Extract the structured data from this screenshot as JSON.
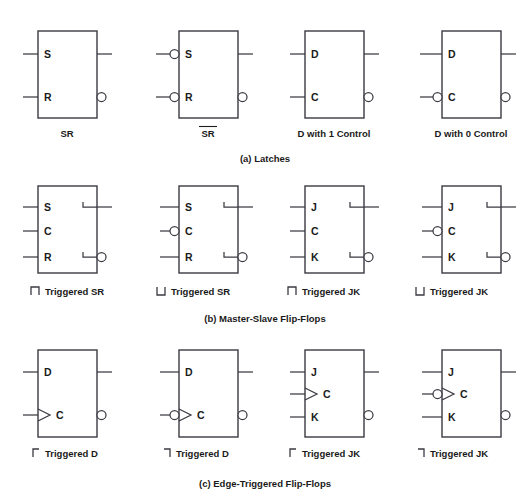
{
  "figure": {
    "background": "#ffffff",
    "line_color": "#3a3a42",
    "text_color": "#1a1a1a",
    "sections": [
      {
        "id": "a",
        "caption": "(a) Latches"
      },
      {
        "id": "b",
        "caption": "(b) Master-Slave Flip-Flops"
      },
      {
        "id": "c",
        "caption": "(c) Edge-Triggered Flip-Flops"
      }
    ]
  },
  "row_a": {
    "symbols": [
      {
        "caption": "SR",
        "caption_overline": false,
        "pins": [
          "S",
          "R"
        ],
        "inverted_inputs": [],
        "output_bubble": true,
        "postponed_output": false,
        "dynamic_input": false,
        "dynamic_input_bubble": false
      },
      {
        "caption": "SR",
        "caption_overline": true,
        "pins": [
          "S",
          "R"
        ],
        "inverted_inputs": [
          "S",
          "R"
        ],
        "output_bubble": true,
        "postponed_output": false,
        "dynamic_input": false,
        "dynamic_input_bubble": false
      },
      {
        "caption": "D with 1 Control",
        "caption_overline": false,
        "pins": [
          "D",
          "C"
        ],
        "inverted_inputs": [],
        "output_bubble": true,
        "postponed_output": false,
        "dynamic_input": false,
        "dynamic_input_bubble": false
      },
      {
        "caption": "D with 0 Control",
        "caption_overline": false,
        "pins": [
          "D",
          "C"
        ],
        "inverted_inputs": [
          "C"
        ],
        "output_bubble": true,
        "postponed_output": false,
        "dynamic_input": false,
        "dynamic_input_bubble": false
      }
    ]
  },
  "row_b": {
    "symbols": [
      {
        "caption": "Triggered SR",
        "glyph": "positive-pulse",
        "pins": [
          "S",
          "C",
          "R"
        ],
        "inverted_inputs": [],
        "output_bubble": true,
        "postponed_output": true
      },
      {
        "caption": "Triggered SR",
        "glyph": "negative-pulse",
        "pins": [
          "S",
          "C",
          "R"
        ],
        "inverted_inputs": [
          "C"
        ],
        "output_bubble": true,
        "postponed_output": true
      },
      {
        "caption": "Triggered JK",
        "glyph": "positive-pulse",
        "pins": [
          "J",
          "C",
          "K"
        ],
        "inverted_inputs": [],
        "output_bubble": true,
        "postponed_output": true
      },
      {
        "caption": "Triggered JK",
        "glyph": "negative-pulse",
        "pins": [
          "J",
          "C",
          "K"
        ],
        "inverted_inputs": [
          "C"
        ],
        "output_bubble": true,
        "postponed_output": true
      }
    ]
  },
  "row_c": {
    "symbols": [
      {
        "caption": "Triggered D",
        "glyph": "rising-edge",
        "pins": [
          "D",
          "C"
        ],
        "inverted_inputs": [],
        "output_bubble": true,
        "dynamic_input": true,
        "dynamic_input_bubble": false
      },
      {
        "caption": "Triggered D",
        "glyph": "falling-edge",
        "pins": [
          "D",
          "C"
        ],
        "inverted_inputs": [
          "C"
        ],
        "output_bubble": true,
        "dynamic_input": true,
        "dynamic_input_bubble": true
      },
      {
        "caption": "Triggered JK",
        "glyph": "rising-edge",
        "pins": [
          "J",
          "C",
          "K"
        ],
        "inverted_inputs": [],
        "output_bubble": true,
        "dynamic_input": true,
        "dynamic_input_bubble": false
      },
      {
        "caption": "Triggered JK",
        "glyph": "falling-edge",
        "pins": [
          "J",
          "C",
          "K"
        ],
        "inverted_inputs": [
          "C"
        ],
        "output_bubble": true,
        "dynamic_input": true,
        "dynamic_input_bubble": true
      }
    ]
  }
}
